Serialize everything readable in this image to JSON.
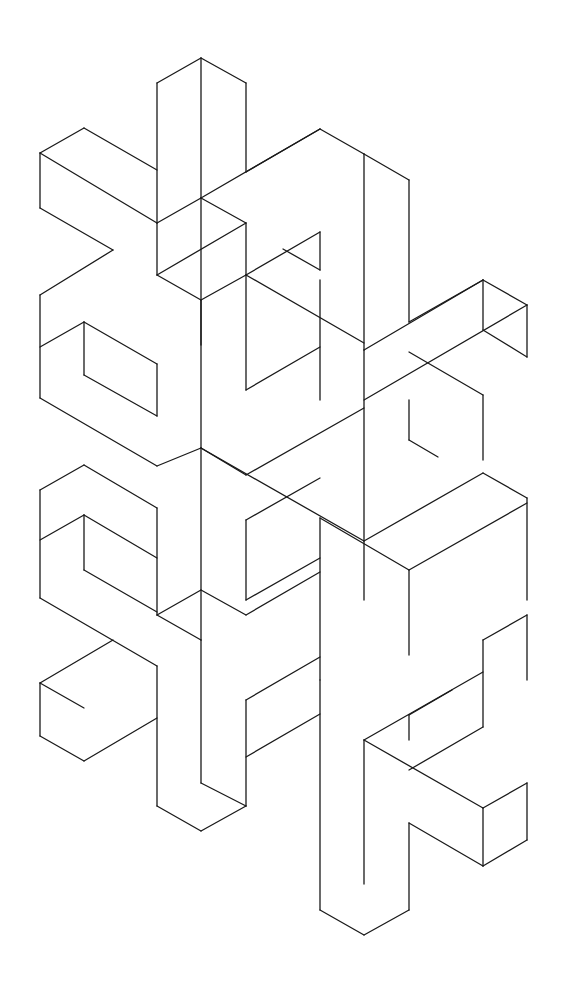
{
  "figure": {
    "stroke_color": "#1a1a1a",
    "background": "#ffffff",
    "segments": [
      [
        157,
        83,
        201,
        58
      ],
      [
        201,
        58,
        246,
        83
      ],
      [
        201,
        58,
        201,
        198
      ],
      [
        157,
        83,
        157,
        223
      ],
      [
        246,
        83,
        246,
        172
      ],
      [
        40,
        153,
        84,
        128
      ],
      [
        84,
        128,
        157,
        170
      ],
      [
        40,
        153,
        40,
        208
      ],
      [
        40,
        153,
        157,
        223
      ],
      [
        40,
        208,
        113,
        250
      ],
      [
        157,
        223,
        201,
        198
      ],
      [
        201,
        198,
        246,
        223
      ],
      [
        246,
        172,
        320,
        129
      ],
      [
        320,
        129,
        364,
        154
      ],
      [
        364,
        154,
        409,
        180
      ],
      [
        409,
        180,
        409,
        322
      ],
      [
        364,
        154,
        364,
        350
      ],
      [
        201,
        198,
        320,
        129
      ],
      [
        157,
        223,
        157,
        275
      ],
      [
        246,
        223,
        246,
        275
      ],
      [
        201,
        198,
        201,
        345
      ],
      [
        40,
        295,
        113,
        250
      ],
      [
        40,
        295,
        40,
        398
      ],
      [
        40,
        347,
        84,
        322
      ],
      [
        84,
        322,
        84,
        375
      ],
      [
        84,
        322,
        157,
        364
      ],
      [
        157,
        275,
        246,
        223
      ],
      [
        157,
        275,
        201,
        300
      ],
      [
        201,
        300,
        246,
        275
      ],
      [
        246,
        275,
        320,
        232
      ],
      [
        246,
        275,
        364,
        343
      ],
      [
        320,
        232,
        320,
        270
      ],
      [
        320,
        270,
        283,
        249
      ],
      [
        40,
        398,
        157,
        466
      ],
      [
        84,
        375,
        157,
        416
      ],
      [
        157,
        364,
        157,
        416
      ],
      [
        201,
        300,
        201,
        448
      ],
      [
        246,
        275,
        246,
        390
      ],
      [
        246,
        390,
        320,
        347
      ],
      [
        320,
        280,
        320,
        400
      ],
      [
        409,
        322,
        483,
        280
      ],
      [
        483,
        280,
        527,
        305
      ],
      [
        483,
        280,
        483,
        330
      ],
      [
        527,
        305,
        527,
        357
      ],
      [
        483,
        330,
        527,
        357
      ],
      [
        364,
        350,
        483,
        280
      ],
      [
        364,
        400,
        527,
        305
      ],
      [
        409,
        352,
        483,
        395
      ],
      [
        483,
        395,
        483,
        460
      ],
      [
        157,
        466,
        201,
        448
      ],
      [
        201,
        448,
        246,
        475
      ],
      [
        246,
        475,
        364,
        408
      ],
      [
        201,
        448,
        364,
        541
      ],
      [
        364,
        350,
        364,
        600
      ],
      [
        409,
        400,
        409,
        440
      ],
      [
        409,
        440,
        438,
        457
      ],
      [
        40,
        490,
        84,
        465
      ],
      [
        84,
        465,
        157,
        508
      ],
      [
        40,
        490,
        40,
        598
      ],
      [
        40,
        540,
        84,
        515
      ],
      [
        84,
        515,
        84,
        570
      ],
      [
        84,
        515,
        157,
        558
      ],
      [
        157,
        508,
        157,
        615
      ],
      [
        40,
        598,
        157,
        666
      ],
      [
        84,
        570,
        157,
        612
      ],
      [
        201,
        448,
        201,
        640
      ],
      [
        246,
        520,
        246,
        600
      ],
      [
        246,
        520,
        320,
        478
      ],
      [
        246,
        600,
        320,
        558
      ],
      [
        320,
        518,
        320,
        680
      ],
      [
        320,
        518,
        409,
        570
      ],
      [
        364,
        541,
        483,
        473
      ],
      [
        409,
        570,
        527,
        503
      ],
      [
        483,
        473,
        527,
        498
      ],
      [
        527,
        498,
        527,
        600
      ],
      [
        409,
        570,
        409,
        655
      ],
      [
        157,
        615,
        201,
        590
      ],
      [
        201,
        590,
        246,
        615
      ],
      [
        246,
        615,
        320,
        572
      ],
      [
        157,
        615,
        201,
        640
      ],
      [
        40,
        683,
        113,
        640
      ],
      [
        40,
        683,
        40,
        736
      ],
      [
        40,
        736,
        84,
        761
      ],
      [
        84,
        761,
        157,
        718
      ],
      [
        40,
        683,
        84,
        708
      ],
      [
        157,
        666,
        157,
        806
      ],
      [
        201,
        640,
        201,
        783
      ],
      [
        157,
        806,
        201,
        831
      ],
      [
        201,
        831,
        246,
        806
      ],
      [
        246,
        806,
        246,
        700
      ],
      [
        201,
        783,
        246,
        806
      ],
      [
        246,
        700,
        320,
        657
      ],
      [
        246,
        757,
        320,
        714
      ],
      [
        320,
        680,
        320,
        910
      ],
      [
        364,
        740,
        364,
        884
      ],
      [
        320,
        910,
        364,
        935
      ],
      [
        364,
        935,
        409,
        910
      ],
      [
        409,
        910,
        409,
        823
      ],
      [
        364,
        740,
        483,
        672
      ],
      [
        409,
        770,
        483,
        727
      ],
      [
        483,
        727,
        483,
        640
      ],
      [
        483,
        640,
        527,
        615
      ],
      [
        527,
        615,
        527,
        680
      ],
      [
        364,
        740,
        483,
        808
      ],
      [
        409,
        823,
        483,
        866
      ],
      [
        483,
        808,
        527,
        783
      ],
      [
        527,
        783,
        527,
        840
      ],
      [
        483,
        866,
        527,
        840
      ],
      [
        483,
        808,
        483,
        866
      ],
      [
        409,
        715,
        409,
        740
      ],
      [
        409,
        715,
        452,
        690
      ]
    ]
  }
}
